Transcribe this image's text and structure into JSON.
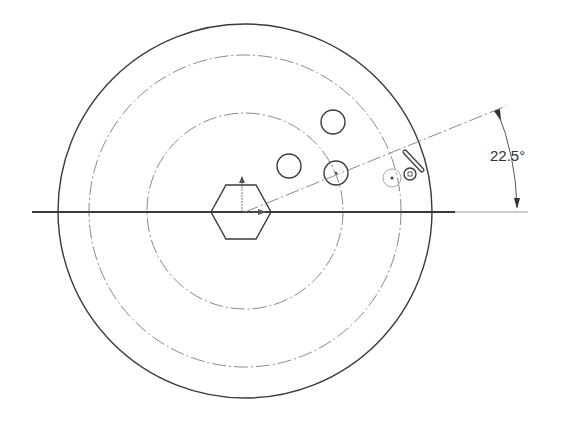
{
  "drawing": {
    "center": {
      "x": 245,
      "y": 212
    },
    "outer_circle": {
      "r": 187,
      "stroke": "#3a3a3a"
    },
    "construction_circles": [
      {
        "name": "middle-construction-circle",
        "r": 156
      },
      {
        "name": "inner-construction-circle",
        "r": 98
      }
    ],
    "centerline": {
      "x1": 32,
      "x2": 455,
      "y": 212
    },
    "extension_line": {
      "x1": 455,
      "x2": 528,
      "y": 212
    },
    "angle_line": {
      "x2": 506,
      "y2": 106
    },
    "hexagon": {
      "cx": 241,
      "cy": 212,
      "r": 30
    },
    "holes": [
      {
        "name": "hole-top",
        "cx": 333,
        "cy": 122,
        "r": 12
      },
      {
        "name": "hole-left",
        "cx": 289,
        "cy": 166,
        "r": 12
      },
      {
        "name": "hole-on-inner-circle",
        "cx": 336,
        "cy": 173,
        "r": 12
      },
      {
        "name": "hole-preview",
        "cx": 392,
        "cy": 178,
        "r": 8
      }
    ],
    "dimension": {
      "label": "22.5°",
      "angle_deg": 22.5,
      "text_x": 491,
      "text_y": 148
    },
    "cursor": {
      "type": "sketch-circle-pencil",
      "x": 405,
      "y": 172
    },
    "line_color": "#3a3a3a",
    "construction_color": "#8a8a8a"
  }
}
